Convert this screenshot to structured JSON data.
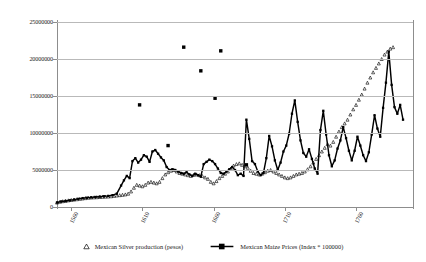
{
  "chart_data": {
    "type": "scatter",
    "title": "",
    "xlabel": "",
    "ylabel": "",
    "xlim": [
      1550,
      1800
    ],
    "ylim": [
      0,
      25000000
    ],
    "grid": true,
    "legend_position": "bottom",
    "y_ticks": [
      0,
      5000000,
      10000000,
      15000000,
      20000000,
      25000000
    ],
    "y_tick_labels": [
      "0",
      "5000000",
      "10000000",
      "15000000",
      "20000000",
      "25000000"
    ],
    "x_ticks": [
      1560,
      1610,
      1660,
      1710,
      1760
    ],
    "x_tick_labels": [
      "1560",
      "1610",
      "1660",
      "1710",
      "1760"
    ],
    "series": [
      {
        "name": "Mexican Silver production (pesos)",
        "marker": "triangle-open",
        "color": "#000000",
        "points": [
          [
            1550,
            600000
          ],
          [
            1552,
            700000
          ],
          [
            1554,
            780000
          ],
          [
            1556,
            820000
          ],
          [
            1558,
            900000
          ],
          [
            1560,
            950000
          ],
          [
            1562,
            1000000
          ],
          [
            1564,
            1050000
          ],
          [
            1566,
            1100000
          ],
          [
            1568,
            1150000
          ],
          [
            1570,
            1200000
          ],
          [
            1572,
            1250000
          ],
          [
            1574,
            1280000
          ],
          [
            1576,
            1300000
          ],
          [
            1578,
            1320000
          ],
          [
            1580,
            1350000
          ],
          [
            1582,
            1380000
          ],
          [
            1584,
            1400000
          ],
          [
            1586,
            1420000
          ],
          [
            1588,
            1450000
          ],
          [
            1590,
            1500000
          ],
          [
            1592,
            1550000
          ],
          [
            1594,
            1600000
          ],
          [
            1596,
            1650000
          ],
          [
            1598,
            1700000
          ],
          [
            1600,
            1800000
          ],
          [
            1602,
            2100000
          ],
          [
            1604,
            2600000
          ],
          [
            1606,
            3000000
          ],
          [
            1608,
            2900000
          ],
          [
            1610,
            2800000
          ],
          [
            1612,
            3000000
          ],
          [
            1614,
            3300000
          ],
          [
            1616,
            3400000
          ],
          [
            1618,
            3300000
          ],
          [
            1620,
            3200000
          ],
          [
            1622,
            3400000
          ],
          [
            1624,
            3900000
          ],
          [
            1626,
            4400000
          ],
          [
            1628,
            4700000
          ],
          [
            1630,
            4900000
          ],
          [
            1632,
            5000000
          ],
          [
            1634,
            4800000
          ],
          [
            1636,
            4600000
          ],
          [
            1638,
            4500000
          ],
          [
            1640,
            4400000
          ],
          [
            1642,
            4300000
          ],
          [
            1644,
            4200000
          ],
          [
            1646,
            4350000
          ],
          [
            1648,
            4400000
          ],
          [
            1650,
            4300000
          ],
          [
            1652,
            4200000
          ],
          [
            1654,
            4000000
          ],
          [
            1656,
            3800000
          ],
          [
            1658,
            3400000
          ],
          [
            1660,
            3200000
          ],
          [
            1662,
            3500000
          ],
          [
            1664,
            3900000
          ],
          [
            1666,
            4200000
          ],
          [
            1668,
            4500000
          ],
          [
            1670,
            4800000
          ],
          [
            1672,
            5200000
          ],
          [
            1674,
            5600000
          ],
          [
            1676,
            5800000
          ],
          [
            1678,
            5900000
          ],
          [
            1680,
            5700000
          ],
          [
            1682,
            5500000
          ],
          [
            1684,
            5300000
          ],
          [
            1686,
            4900000
          ],
          [
            1688,
            4600000
          ],
          [
            1690,
            4500000
          ],
          [
            1692,
            4400000
          ],
          [
            1694,
            4500000
          ],
          [
            1696,
            4700000
          ],
          [
            1698,
            4900000
          ],
          [
            1700,
            5000000
          ],
          [
            1702,
            4800000
          ],
          [
            1704,
            4600000
          ],
          [
            1706,
            4400000
          ],
          [
            1708,
            4200000
          ],
          [
            1710,
            4000000
          ],
          [
            1712,
            3900000
          ],
          [
            1714,
            4000000
          ],
          [
            1716,
            4200000
          ],
          [
            1718,
            4400000
          ],
          [
            1720,
            4500000
          ],
          [
            1722,
            4600000
          ],
          [
            1724,
            4800000
          ],
          [
            1726,
            5100000
          ],
          [
            1728,
            5500000
          ],
          [
            1730,
            6000000
          ],
          [
            1732,
            6500000
          ],
          [
            1734,
            7000000
          ],
          [
            1736,
            7500000
          ],
          [
            1738,
            8000000
          ],
          [
            1740,
            8500000
          ],
          [
            1742,
            8300000
          ],
          [
            1744,
            8800000
          ],
          [
            1746,
            9500000
          ],
          [
            1748,
            10200000
          ],
          [
            1750,
            10800000
          ],
          [
            1752,
            11300000
          ],
          [
            1754,
            11800000
          ],
          [
            1756,
            12500000
          ],
          [
            1758,
            13200000
          ],
          [
            1760,
            13800000
          ],
          [
            1762,
            14500000
          ],
          [
            1764,
            15200000
          ],
          [
            1766,
            16000000
          ],
          [
            1768,
            16800000
          ],
          [
            1770,
            17500000
          ],
          [
            1772,
            18200000
          ],
          [
            1774,
            18800000
          ],
          [
            1776,
            19400000
          ],
          [
            1778,
            20000000
          ],
          [
            1780,
            20600000
          ],
          [
            1782,
            21000000
          ],
          [
            1784,
            21400000
          ],
          [
            1786,
            21600000
          ]
        ]
      },
      {
        "name": "Mexican Maize Prices (Index * 100000)",
        "marker": "square-filled",
        "color": "#000000",
        "points": [
          [
            1550,
            600000
          ],
          [
            1553,
            750000
          ],
          [
            1556,
            820000
          ],
          [
            1559,
            900000
          ],
          [
            1562,
            1000000
          ],
          [
            1565,
            1100000
          ],
          [
            1568,
            1200000
          ],
          [
            1571,
            1250000
          ],
          [
            1574,
            1300000
          ],
          [
            1577,
            1350000
          ],
          [
            1580,
            1400000
          ],
          [
            1583,
            1450000
          ],
          [
            1586,
            1500000
          ],
          [
            1589,
            1600000
          ],
          [
            1592,
            1800000
          ],
          [
            1595,
            2900000
          ],
          [
            1597,
            3600000
          ],
          [
            1599,
            4200000
          ],
          [
            1601,
            3900000
          ],
          [
            1603,
            6200000
          ],
          [
            1605,
            6600000
          ],
          [
            1607,
            6000000
          ],
          [
            1609,
            6400000
          ],
          [
            1611,
            7000000
          ],
          [
            1613,
            6800000
          ],
          [
            1615,
            6100000
          ],
          [
            1617,
            7500000
          ],
          [
            1619,
            7700000
          ],
          [
            1621,
            7200000
          ],
          [
            1623,
            6700000
          ],
          [
            1625,
            6300000
          ],
          [
            1627,
            5400000
          ],
          [
            1629,
            5000000
          ],
          [
            1631,
            5100000
          ],
          [
            1633,
            5000000
          ],
          [
            1635,
            4800000
          ],
          [
            1637,
            4600000
          ],
          [
            1639,
            4500000
          ],
          [
            1641,
            4700000
          ],
          [
            1643,
            4400000
          ],
          [
            1645,
            4200000
          ],
          [
            1647,
            4500000
          ],
          [
            1649,
            4300000
          ],
          [
            1651,
            4100000
          ],
          [
            1653,
            5800000
          ],
          [
            1655,
            6100000
          ],
          [
            1657,
            6400000
          ],
          [
            1659,
            6200000
          ],
          [
            1661,
            5800000
          ],
          [
            1663,
            5200000
          ],
          [
            1665,
            4600000
          ],
          [
            1667,
            4500000
          ],
          [
            1669,
            4800000
          ],
          [
            1671,
            5100000
          ],
          [
            1673,
            5400000
          ],
          [
            1675,
            5000000
          ],
          [
            1677,
            4300000
          ],
          [
            1679,
            4500000
          ],
          [
            1681,
            4200000
          ],
          [
            1683,
            11800000
          ],
          [
            1685,
            9200000
          ],
          [
            1687,
            6200000
          ],
          [
            1689,
            5800000
          ],
          [
            1691,
            4800000
          ],
          [
            1693,
            4300000
          ],
          [
            1695,
            4600000
          ],
          [
            1697,
            6600000
          ],
          [
            1699,
            9600000
          ],
          [
            1701,
            8200000
          ],
          [
            1703,
            6300000
          ],
          [
            1705,
            5000000
          ],
          [
            1707,
            6000000
          ],
          [
            1709,
            7500000
          ],
          [
            1711,
            8300000
          ],
          [
            1713,
            9900000
          ],
          [
            1715,
            12600000
          ],
          [
            1717,
            14400000
          ],
          [
            1719,
            11500000
          ],
          [
            1721,
            9000000
          ],
          [
            1723,
            7300000
          ],
          [
            1725,
            6800000
          ],
          [
            1727,
            7800000
          ],
          [
            1729,
            6500000
          ],
          [
            1731,
            5200000
          ],
          [
            1733,
            4500000
          ],
          [
            1735,
            10400000
          ],
          [
            1737,
            13000000
          ],
          [
            1739,
            9800000
          ],
          [
            1741,
            7000000
          ],
          [
            1743,
            5500000
          ],
          [
            1745,
            6300000
          ],
          [
            1747,
            7900000
          ],
          [
            1749,
            9000000
          ],
          [
            1751,
            10800000
          ],
          [
            1753,
            9300000
          ],
          [
            1755,
            7600000
          ],
          [
            1757,
            6300000
          ],
          [
            1759,
            7600000
          ],
          [
            1761,
            9500000
          ],
          [
            1763,
            8300000
          ],
          [
            1765,
            7000000
          ],
          [
            1767,
            6200000
          ],
          [
            1769,
            7400000
          ],
          [
            1771,
            9800000
          ],
          [
            1773,
            12400000
          ],
          [
            1775,
            10600000
          ],
          [
            1777,
            9500000
          ],
          [
            1779,
            13400000
          ],
          [
            1781,
            16800000
          ],
          [
            1783,
            21000000
          ],
          [
            1785,
            16500000
          ],
          [
            1787,
            13500000
          ],
          [
            1789,
            12600000
          ],
          [
            1791,
            13800000
          ],
          [
            1793,
            11800000
          ]
        ]
      },
      {
        "name": "Maize price outliers",
        "marker": "square-filled",
        "color": "#000000",
        "points": [
          [
            1608,
            13800000
          ],
          [
            1628,
            8300000
          ],
          [
            1639,
            21600000
          ],
          [
            1651,
            18400000
          ],
          [
            1661,
            14700000
          ],
          [
            1665,
            21100000
          ],
          [
            1683,
            5700000
          ]
        ]
      }
    ]
  },
  "legend": {
    "items": [
      {
        "label": "Mexican Silver production (pesos)",
        "marker": "triangle-open-icon"
      },
      {
        "label": "Mexican Maize Prices (Index * 100000)",
        "marker": "square-line-icon"
      }
    ]
  }
}
